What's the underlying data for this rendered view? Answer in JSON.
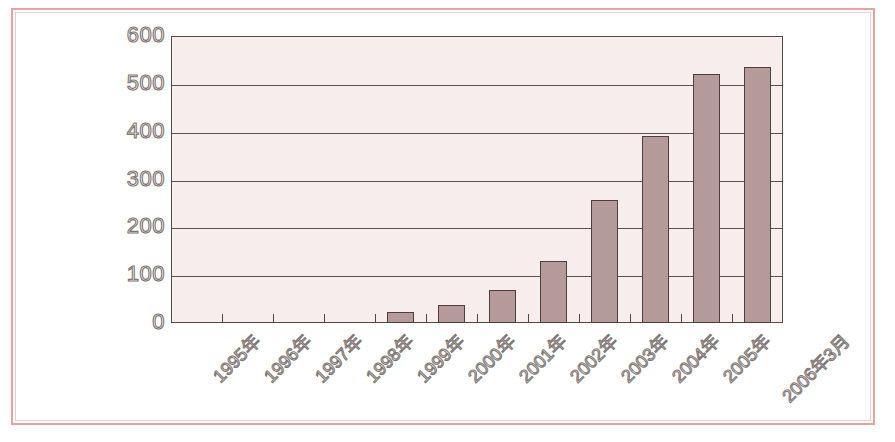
{
  "chart_data": {
    "type": "bar",
    "title": "",
    "subtitle": "",
    "xlabel": "",
    "ylabel": "",
    "categories": [
      "1995年",
      "1996年",
      "1997年",
      "1998年",
      "1999年",
      "2000年",
      "2001年",
      "2002年",
      "2003年",
      "2004年",
      "2005年",
      "2006年3月"
    ],
    "values": [
      0,
      0,
      0,
      0,
      23,
      37,
      68,
      130,
      258,
      390,
      520,
      535
    ],
    "ylim": [
      0,
      600
    ],
    "ytick_labels": [
      "600",
      "500",
      "400",
      "300",
      "200",
      "100",
      "0"
    ],
    "ytick_values": [
      600,
      500,
      400,
      300,
      200,
      100,
      0
    ],
    "ytick_step": 100,
    "grid": true,
    "legend": false,
    "legend_position": "none",
    "annotations": []
  },
  "style": {
    "bar_fill": "#b59a9a",
    "bar_stroke": "#4d3f3f",
    "plot_background": "#f8eded",
    "gridline_color": "#5a5150",
    "axis_color": "#514a49",
    "tick_label_color": "#7d7471",
    "frame_color": "#e8a0a0",
    "page_background": "#ffffff"
  }
}
